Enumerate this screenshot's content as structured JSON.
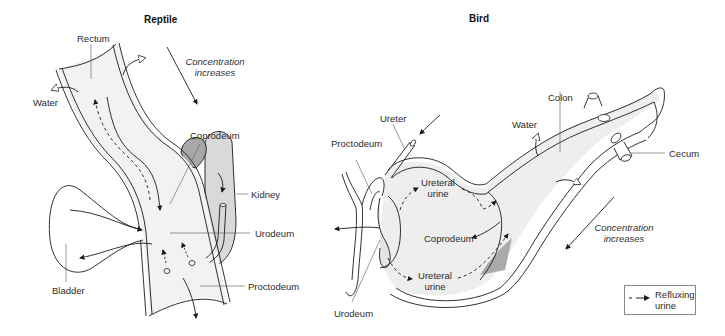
{
  "panels": [
    {
      "id": "reptile",
      "title": "Reptile",
      "labels": {
        "rectum": "Rectum",
        "water": "Water",
        "coprodeum": "Coprodeum",
        "kidney": "Kidney",
        "urodeum": "Urodeum",
        "bladder": "Bladder",
        "proctodeum": "Proctodeum"
      },
      "concentration": {
        "line1": "Concentration",
        "line2": "increases"
      }
    },
    {
      "id": "bird",
      "title": "Bird",
      "labels": {
        "ureter": "Ureter",
        "proctodeum": "Proctodeum",
        "water": "Water",
        "colon": "Colon",
        "cecum": "Cecum",
        "ureteral_urine_top_1": "Ureteral",
        "ureteral_urine_top_2": "urine",
        "coprodeum": "Coprodeum",
        "ureteral_urine_bottom_1": "Ureteral",
        "ureteral_urine_bottom_2": "urine",
        "urodeum": "Urodeum"
      },
      "concentration": {
        "line1": "Concentration",
        "line2": "increases"
      }
    }
  ],
  "legend": {
    "symbol": "dashed-arrow",
    "line1": "Refluxing",
    "line2": "urine"
  },
  "colors": {
    "line": "#1a1a1a",
    "fill_light": "#f0f0f0",
    "fill_mid": "#cfcfcf",
    "fill_dark": "#a8a8a8"
  }
}
